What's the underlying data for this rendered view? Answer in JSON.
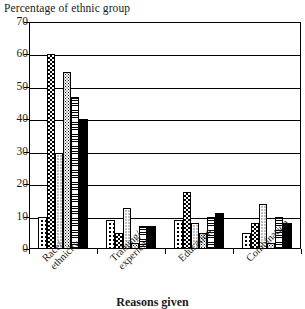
{
  "chart_data": {
    "type": "bar",
    "title": "Percentage of ethnic group",
    "xlabel": "Reasons given",
    "ylabel": "Percentage of ethnic group",
    "ylim": [
      0,
      70
    ],
    "ytick_step": 10,
    "ytick_labels": [
      "0",
      "10",
      "20",
      "30",
      "40",
      "50",
      "60",
      "70"
    ],
    "grid": true,
    "legend": "none",
    "categories": [
      "Race/ethnicity",
      "Training/experience",
      "Education",
      "Combination"
    ],
    "category_lines": [
      [
        "Race/",
        "ethnicity"
      ],
      [
        "Training/",
        "experience"
      ],
      [
        "Education",
        ""
      ],
      [
        "Combination",
        ""
      ]
    ],
    "series": [
      {
        "name": "series-1",
        "pattern": "dots-sparse",
        "values": [
          10,
          9,
          9,
          5
        ]
      },
      {
        "name": "series-2",
        "pattern": "checker",
        "values": [
          60,
          5,
          17.5,
          8
        ]
      },
      {
        "name": "series-3",
        "pattern": "dots-fine",
        "values": [
          29.5,
          12.5,
          8,
          14
        ]
      },
      {
        "name": "series-4",
        "pattern": "grain",
        "values": [
          54.5,
          2,
          5,
          2
        ]
      },
      {
        "name": "series-5",
        "pattern": "hlines",
        "values": [
          47,
          7,
          10,
          10
        ]
      },
      {
        "name": "series-6",
        "pattern": "solid",
        "values": [
          40,
          7,
          11,
          8
        ]
      }
    ]
  }
}
